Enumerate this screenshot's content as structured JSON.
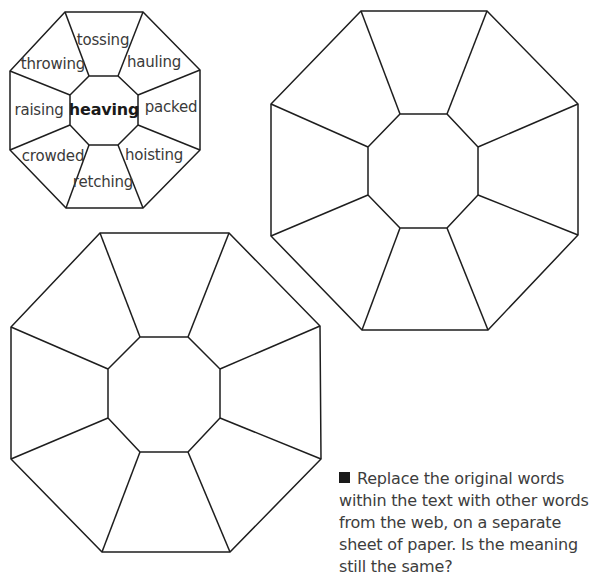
{
  "example_octagon": {
    "center_word": "heaving",
    "outer_words": [
      {
        "id": "top",
        "text": "tossing"
      },
      {
        "id": "top-right",
        "text": "hauling"
      },
      {
        "id": "right",
        "text": "packed"
      },
      {
        "id": "bottom-right",
        "text": "hoisting"
      },
      {
        "id": "bottom",
        "text": "retching"
      },
      {
        "id": "bottom-left",
        "text": "crowded"
      },
      {
        "id": "left",
        "text": "raising"
      },
      {
        "id": "top-left",
        "text": "throwing"
      }
    ]
  },
  "blank_octagons": [
    {
      "id": "right-large",
      "segments": 8
    },
    {
      "id": "bottom-left-large",
      "segments": 8
    }
  ],
  "instruction": {
    "bullet": "square-bullet",
    "text": "Replace the original words within the text with other words from the web, on a separate sheet of paper. Is the meaning still the same?"
  },
  "colors": {
    "line": "#1e1e1e",
    "text": "#3a3a3a",
    "background": "#ffffff"
  }
}
